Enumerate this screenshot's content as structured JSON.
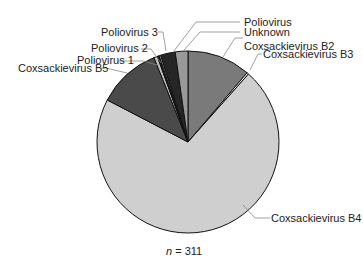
{
  "chart_data": {
    "type": "pie",
    "title": "",
    "annotation": "n = 311",
    "total": 311,
    "slices": [
      {
        "label": "Coxsackievirus B2",
        "value": 35,
        "color": "#7a7a7a"
      },
      {
        "label": "Coxsackievirus B3",
        "value": 1,
        "color": "#ffffff"
      },
      {
        "label": "Coxsackievirus B4",
        "value": 221,
        "color": "#cfcfcf"
      },
      {
        "label": "Coxsackievirus B5",
        "value": 35,
        "color": "#4a4a4a"
      },
      {
        "label": "Poliovirus 1",
        "value": 2,
        "color": "#bdbdbd"
      },
      {
        "label": "Poliovirus 2",
        "value": 1,
        "color": "#111111"
      },
      {
        "label": "Poliovirus 3",
        "value": 1,
        "color": "#8a8a8a"
      },
      {
        "label": "Poliovirus",
        "value": 8,
        "color": "#262626"
      },
      {
        "label": "Unknown",
        "value": 7,
        "color": "#999999"
      }
    ],
    "start_angle_deg": 0,
    "direction": "clockwise"
  },
  "labels": {
    "n_prefix": "n",
    "n_value": " = 311",
    "b2": "Coxsackievirus B2",
    "b3": "Coxsackievirus B3",
    "b4": "Coxsackievirus B4",
    "b5": "Coxsackievirus B5",
    "p1": "Poliovirus 1",
    "p2": "Poliovirus 2",
    "p3": "Poliovirus 3",
    "p": "Poliovirus",
    "unk": "Unknown"
  }
}
